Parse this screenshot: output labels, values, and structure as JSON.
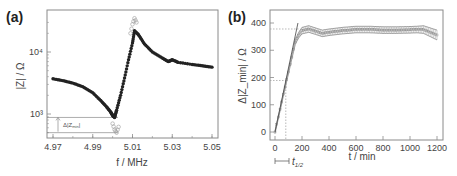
{
  "panels": {
    "a": {
      "label": "(a)",
      "xlabel": "f / MHz",
      "ylabel": "|Z| / Ω",
      "xticks": [
        "4.97",
        "4.99",
        "5.01",
        "5.03",
        "5.05"
      ],
      "yticks": [
        "10³",
        "10⁴"
      ],
      "annotation": "Δ|Z_min|"
    },
    "b": {
      "label": "(b)",
      "xlabel": "t / min",
      "ylabel": "Δ|Z_min| / Ω",
      "xticks": [
        "0",
        "200",
        "400",
        "600",
        "800",
        "1000",
        "1200"
      ],
      "yticks": [
        "0",
        "100",
        "200",
        "300",
        "400"
      ],
      "annotation": "t_1/2"
    }
  },
  "chart_data": [
    {
      "type": "scatter",
      "title": "(a)",
      "xlabel": "f / MHz",
      "ylabel": "|Z| / Ω",
      "xlim": [
        4.967,
        5.052
      ],
      "ylim": [
        400,
        40000
      ],
      "yscale": "log",
      "xticks": [
        4.97,
        4.99,
        5.01,
        5.03,
        5.05
      ],
      "yticks": [
        1000,
        10000
      ],
      "series": [
        {
          "name": "filled (reference)",
          "marker": "filled-circle",
          "x": [
            4.97,
            4.975,
            4.98,
            4.985,
            4.99,
            4.994,
            4.997,
            4.999,
            5.0,
            5.001,
            5.002,
            5.004,
            5.006,
            5.008,
            5.01,
            5.011,
            5.013,
            5.016,
            5.02,
            5.025,
            5.028,
            5.03,
            5.033,
            5.04,
            5.045,
            5.05
          ],
          "y": [
            3700,
            3450,
            3150,
            2750,
            2200,
            1650,
            1300,
            1080,
            950,
            880,
            1150,
            2000,
            3800,
            7500,
            14000,
            22000,
            19000,
            13500,
            10000,
            8000,
            7000,
            7500,
            6800,
            6300,
            6000,
            5700
          ]
        },
        {
          "name": "open (loaded)",
          "marker": "open-circle",
          "x": [
            5.0,
            5.001,
            5.002,
            5.003,
            5.009,
            5.01,
            5.011,
            5.012
          ],
          "y": [
            700,
            560,
            500,
            620,
            20000,
            28000,
            35000,
            30000
          ]
        }
      ],
      "annotations": [
        {
          "text": "Δ|Z_min|",
          "type": "double-arrow-vertical",
          "y_from": 880,
          "y_to": 500
        }
      ]
    },
    {
      "type": "line",
      "title": "(b)",
      "xlabel": "t / min",
      "ylabel": "Δ|Z_min| / Ω",
      "xlim": [
        -30,
        1230
      ],
      "ylim": [
        -30,
        450
      ],
      "xticks": [
        0,
        200,
        400,
        600,
        800,
        1000,
        1200
      ],
      "yticks": [
        0,
        100,
        200,
        300,
        400
      ],
      "series": [
        {
          "name": "Δ|Z_min| (mean ± error)",
          "x": [
            0,
            25,
            50,
            75,
            100,
            125,
            150,
            175,
            200,
            250,
            300,
            350,
            400,
            500,
            600,
            700,
            800,
            900,
            1000,
            1050,
            1100,
            1150,
            1200
          ],
          "y": [
            0,
            55,
            110,
            165,
            220,
            275,
            330,
            355,
            372,
            378,
            370,
            362,
            366,
            372,
            376,
            376,
            374,
            374,
            375,
            376,
            376,
            366,
            356
          ],
          "err": [
            5,
            5,
            5,
            5,
            6,
            6,
            8,
            10,
            12,
            12,
            12,
            12,
            12,
            12,
            12,
            12,
            12,
            12,
            12,
            12,
            14,
            16,
            18
          ]
        },
        {
          "name": "linear fit",
          "x": [
            0,
            170
          ],
          "y": [
            0,
            400
          ]
        }
      ],
      "annotations": [
        {
          "text": "plateau",
          "type": "dotted-hline",
          "y": 378
        },
        {
          "text": "half",
          "type": "dotted-hline",
          "y": 189
        },
        {
          "text": "t_1/2",
          "type": "dotted-vline",
          "x": 80
        }
      ]
    }
  ]
}
